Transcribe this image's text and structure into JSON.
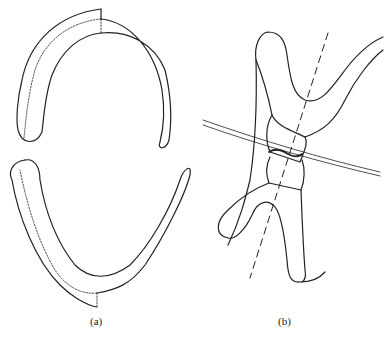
{
  "figure": {
    "panels": [
      {
        "id": "a",
        "label": "(a)",
        "description": "Upper and lower dental arch outlines with dotted midline"
      },
      {
        "id": "b",
        "label": "(b)",
        "description": "Sagittal view of occluding incisors with dashed long axis and occlusal plane line"
      }
    ]
  }
}
